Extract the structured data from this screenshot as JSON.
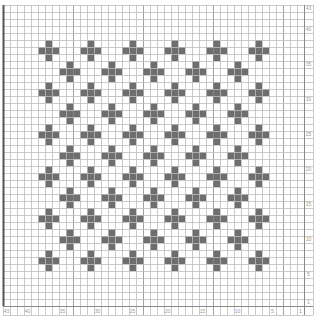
{
  "chart_data": {
    "type": "heatmap",
    "title": "",
    "grid": {
      "columns": 43,
      "rows": 43,
      "cell_px": 7,
      "origin_x": 3,
      "origin_y": 5
    },
    "colors": {
      "cross": "#6e6e6e",
      "gridline": "#bdbdbd",
      "major_gridline": "#8a8a8a",
      "border": "#555555",
      "background": "#ffffff",
      "label": "#9a9a9a"
    },
    "x_tick_labels": [
      "43",
      "40",
      "35",
      "30",
      "25",
      "20",
      "15",
      "10",
      "5",
      "1"
    ],
    "y_tick_labels": [
      "43",
      "40",
      "35",
      "30",
      "25",
      "20",
      "15",
      "10",
      "5",
      "1"
    ],
    "cross_shape": "plus (center cell + 4 adjacent cells)",
    "cross_centers_row_a": {
      "cols": [
        6,
        12,
        18,
        24,
        30,
        36
      ],
      "rows": [
        6,
        12,
        18,
        24,
        30,
        36
      ]
    },
    "cross_centers_row_b": {
      "cols": [
        9,
        15,
        21,
        27,
        33
      ],
      "rows": [
        9,
        15,
        21,
        27,
        33
      ]
    },
    "cross_count": 61
  }
}
